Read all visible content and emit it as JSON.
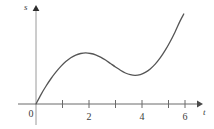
{
  "figure": {
    "background_color": "#ffffff",
    "ink_color": "#555555",
    "text_color": "#3c3c3c"
  },
  "axes": {
    "y_axis": {
      "label": "s",
      "name": "position",
      "arrow": true,
      "origin_px": {
        "x": 36,
        "y": 104
      },
      "top_px": {
        "x": 36,
        "y": 8
      },
      "bottom_px": {
        "x": 36,
        "y": 125
      }
    },
    "x_axis": {
      "label": "t",
      "name": "time",
      "arrow": true,
      "left_px": {
        "x": 18,
        "y": 104
      },
      "right_px": {
        "x": 200,
        "y": 104
      }
    }
  },
  "chart_data": {
    "type": "line",
    "title": "",
    "subtitle": "",
    "xlabel": "t",
    "ylabel": "s",
    "grid": false,
    "legend": null,
    "xlim": [
      -0.7,
      6.2
    ],
    "ylim": [
      -0.8,
      4.6
    ],
    "xticks": [
      1,
      2,
      3,
      4,
      5,
      6
    ],
    "xtick_labels": [
      "",
      "2",
      "",
      "4",
      "",
      "6"
    ],
    "labeled_xticks": [
      {
        "value": 0,
        "label": "0"
      },
      {
        "value": 2,
        "label": "2"
      },
      {
        "value": 4,
        "label": "4"
      },
      {
        "value": 6,
        "label": "6"
      }
    ],
    "yticks": [],
    "ytick_labels": [],
    "series": [
      {
        "name": "s(t)",
        "x": [
          0.0,
          0.2,
          0.4,
          0.6,
          0.8,
          1.0,
          1.2,
          1.4,
          1.6,
          1.8,
          2.0,
          2.2,
          2.4,
          2.6,
          2.8,
          3.0,
          3.2,
          3.4,
          3.6,
          3.8,
          4.0,
          4.2,
          4.4,
          4.6,
          4.8,
          5.0,
          5.2,
          5.4,
          5.6,
          5.8,
          5.95
        ],
        "y": [
          0.0,
          0.49,
          0.92,
          1.31,
          1.65,
          1.95,
          2.2,
          2.4,
          2.54,
          2.62,
          2.65,
          2.62,
          2.55,
          2.43,
          2.28,
          2.1,
          1.92,
          1.75,
          1.61,
          1.52,
          1.49,
          1.53,
          1.64,
          1.82,
          2.07,
          2.39,
          2.78,
          3.23,
          3.74,
          4.3,
          4.67
        ]
      }
    ],
    "annotations": [
      {
        "kind": "local-maximum",
        "x": 2.0,
        "y": 2.65
      },
      {
        "kind": "local-minimum",
        "x": 4.0,
        "y": 1.49
      },
      {
        "kind": "origin-intercept",
        "x": 0.0,
        "y": 0.0
      }
    ]
  },
  "labels": {
    "y_axis_label": "s",
    "x_axis_label": "t",
    "origin": "0",
    "tick_2": "2",
    "tick_4": "4",
    "tick_6": "6"
  }
}
